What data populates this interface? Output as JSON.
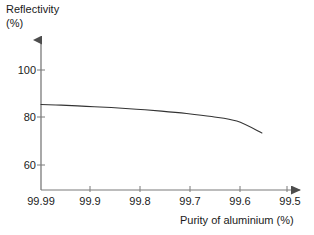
{
  "chart_data": {
    "type": "line",
    "title": "",
    "xlabel": "Purity of aluminium (%)",
    "ylabel": "Reflectivity (%)",
    "ylabel_lines": [
      "Reflectivity",
      "(%)"
    ],
    "xticks": [
      "99.99",
      "99.9",
      "99.8",
      "99.7",
      "99.6",
      "99.5"
    ],
    "xtick_values": [
      99.99,
      99.9,
      99.8,
      99.7,
      99.6,
      99.5
    ],
    "yticks": [
      "100",
      "80",
      "60"
    ],
    "ytick_values": [
      100,
      80,
      60
    ],
    "xlim": [
      99.99,
      99.5
    ],
    "ylim": [
      52,
      108
    ],
    "x_axis_reversed": true,
    "grid": false,
    "legend": null,
    "axis_style": "arrow-ended",
    "line_color": "#333333",
    "series": [
      {
        "name": "Reflectivity vs purity",
        "x": [
          99.99,
          99.95,
          99.9,
          99.85,
          99.8,
          99.75,
          99.7,
          99.65,
          99.6,
          99.55
        ],
        "y": [
          85.5,
          85.2,
          84.7,
          84.2,
          83.5,
          82.7,
          81.7,
          80.4,
          78.5,
          73.5
        ]
      }
    ]
  }
}
